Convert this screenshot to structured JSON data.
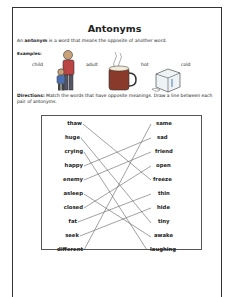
{
  "worksheet": {
    "title": "Antonyms",
    "intro_pre": "An ",
    "intro_bold": "antonym",
    "intro_post": " is a word that means the opposite of another word.",
    "examples_label": "Examples:",
    "examples": [
      {
        "word": "child",
        "picture": "child-figure"
      },
      {
        "word": "adult",
        "picture": "adult-figure"
      },
      {
        "word": "hot",
        "picture": "hot-cocoa-mug"
      },
      {
        "word": "cold",
        "picture": "ice-cube"
      }
    ],
    "directions_label": "Directions:",
    "directions_text": " Match the words that have opposite meanings. Draw a line between each pair of antonyms.",
    "left_words": [
      "thaw",
      "huge",
      "crying",
      "happy",
      "enemy",
      "asleep",
      "closed",
      "fat",
      "seek",
      "different"
    ],
    "right_words": [
      "same",
      "sad",
      "friend",
      "open",
      "freeze",
      "thin",
      "hide",
      "tiny",
      "awake",
      "laughing"
    ],
    "matches": [
      [
        "thaw",
        "freeze"
      ],
      [
        "huge",
        "tiny"
      ],
      [
        "crying",
        "laughing"
      ],
      [
        "happy",
        "sad"
      ],
      [
        "enemy",
        "friend"
      ],
      [
        "asleep",
        "awake"
      ],
      [
        "closed",
        "open"
      ],
      [
        "fat",
        "thin"
      ],
      [
        "seek",
        "hide"
      ],
      [
        "different",
        "same"
      ]
    ]
  }
}
